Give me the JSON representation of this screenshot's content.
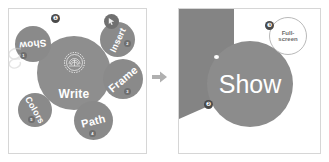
{
  "canvas": {
    "width": 329,
    "height": 162,
    "background": "#ffffff"
  },
  "colors": {
    "panel_border": "#d6d6d6",
    "bubble_fill": "#8a8a8a",
    "center_fill": "#8e8e8e",
    "dark_shape": "#848484",
    "show_circle": "#8c8c8c",
    "callout_badge": "#4a4a4a",
    "text_on_bubble": "#ffffff",
    "ring_outline": "#b9b9b9",
    "ring_text": "#6d6d6d"
  },
  "left_panel": {
    "name": "mindmap-panel",
    "center": {
      "label": "Write"
    },
    "emblem": {
      "icon": "sunburst-gear-icon"
    },
    "swirl": {
      "icon": "spiral-swirl-icon"
    },
    "cursor_chip": {
      "icon": "cursor-arrow-icon"
    },
    "nodes": [
      {
        "label": "Show",
        "badge": "1",
        "rotation": -186
      },
      {
        "label": "Insert",
        "badge": "2",
        "rotation": -65
      },
      {
        "label": "Frame",
        "badge": "3",
        "rotation": -40
      },
      {
        "label": "Path",
        "badge": "4",
        "rotation": -14
      },
      {
        "label": "Colors",
        "badge": "5",
        "rotation": 60
      }
    ],
    "callouts": [
      {
        "number": "❶"
      }
    ]
  },
  "arrow": {
    "icon": "arrow-right-icon",
    "label": "➤"
  },
  "right_panel": {
    "name": "show-preview-panel",
    "show_circle": {
      "label": "Show"
    },
    "fullscreen_ring": {
      "line1": "Full-",
      "line2": "screen"
    },
    "callouts": [
      {
        "number": "❷",
        "name": "callout-2"
      },
      {
        "number": "❸",
        "name": "callout-3"
      }
    ]
  }
}
